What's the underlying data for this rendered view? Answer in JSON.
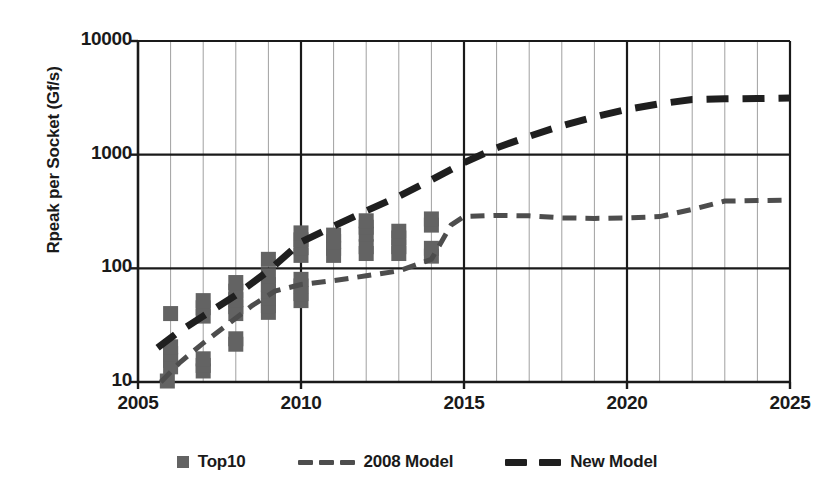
{
  "chart_data": {
    "type": "scatter",
    "title": "",
    "xlabel": "",
    "ylabel": "Rpeak per Socket (Gf/s)",
    "xlim": [
      2005,
      2025
    ],
    "ylim": [
      10,
      10000
    ],
    "yscale": "log",
    "grid": true,
    "legend_position": "bottom",
    "x_ticks": [
      "2005",
      "2010",
      "2015",
      "2020",
      "2025"
    ],
    "x_tick_values": [
      2005,
      2010,
      2015,
      2020,
      2025
    ],
    "y_ticks": [
      "10",
      "100",
      "1000",
      "10000"
    ],
    "y_tick_values": [
      10,
      100,
      1000,
      10000
    ],
    "minor_gridlines_x_every": 1,
    "colors": {
      "marker": "#636363",
      "model_2008": "#4d4d4d",
      "model_new": "#1f1f1f",
      "axis": "#1a1a1a",
      "gridline_minor": "#a0a0a0",
      "gridline_major": "#1a1a1a",
      "background": "#ffffff"
    },
    "series": [
      {
        "name": "Top10",
        "type": "scatter",
        "marker": "square",
        "color": "#636363",
        "points": [
          {
            "x": 2005.9,
            "y": 10.2
          },
          {
            "x": 2006.0,
            "y": 13.6
          },
          {
            "x": 2006.0,
            "y": 15.5
          },
          {
            "x": 2006.0,
            "y": 17.8
          },
          {
            "x": 2006.0,
            "y": 20.4
          },
          {
            "x": 2006.0,
            "y": 40.0
          },
          {
            "x": 2007.0,
            "y": 12.5
          },
          {
            "x": 2007.0,
            "y": 14.0
          },
          {
            "x": 2007.0,
            "y": 16.0
          },
          {
            "x": 2007.0,
            "y": 38.0
          },
          {
            "x": 2007.0,
            "y": 45.0
          },
          {
            "x": 2007.0,
            "y": 52.0
          },
          {
            "x": 2008.0,
            "y": 21.5
          },
          {
            "x": 2008.0,
            "y": 24.0
          },
          {
            "x": 2008.0,
            "y": 40.0
          },
          {
            "x": 2008.0,
            "y": 46.0
          },
          {
            "x": 2008.0,
            "y": 53.0
          },
          {
            "x": 2008.0,
            "y": 63.0
          },
          {
            "x": 2008.0,
            "y": 75.0
          },
          {
            "x": 2009.0,
            "y": 41.0
          },
          {
            "x": 2009.0,
            "y": 47.0
          },
          {
            "x": 2009.0,
            "y": 55.0
          },
          {
            "x": 2009.0,
            "y": 63.0
          },
          {
            "x": 2009.0,
            "y": 72.0
          },
          {
            "x": 2009.0,
            "y": 86.0
          },
          {
            "x": 2009.0,
            "y": 120.0
          },
          {
            "x": 2010.0,
            "y": 52.0
          },
          {
            "x": 2010.0,
            "y": 60.0
          },
          {
            "x": 2010.0,
            "y": 70.0
          },
          {
            "x": 2010.0,
            "y": 80.0
          },
          {
            "x": 2010.0,
            "y": 130.0
          },
          {
            "x": 2010.0,
            "y": 152.0
          },
          {
            "x": 2010.0,
            "y": 178.0
          },
          {
            "x": 2010.0,
            "y": 205.0
          },
          {
            "x": 2011.0,
            "y": 130.0
          },
          {
            "x": 2011.0,
            "y": 150.0
          },
          {
            "x": 2011.0,
            "y": 172.0
          },
          {
            "x": 2011.0,
            "y": 196.0
          },
          {
            "x": 2012.0,
            "y": 135.0
          },
          {
            "x": 2012.0,
            "y": 155.0
          },
          {
            "x": 2012.0,
            "y": 200.0
          },
          {
            "x": 2012.0,
            "y": 230.0
          },
          {
            "x": 2012.0,
            "y": 262.0
          },
          {
            "x": 2013.0,
            "y": 135.0
          },
          {
            "x": 2013.0,
            "y": 155.0
          },
          {
            "x": 2013.0,
            "y": 185.0
          },
          {
            "x": 2013.0,
            "y": 212.0
          },
          {
            "x": 2014.0,
            "y": 128.0
          },
          {
            "x": 2014.0,
            "y": 150.0
          },
          {
            "x": 2014.0,
            "y": 240.0
          },
          {
            "x": 2014.0,
            "y": 272.0
          }
        ]
      },
      {
        "name": "2008 Model",
        "type": "line",
        "style": "dashed-thin",
        "color": "#4d4d4d",
        "points": [
          {
            "x": 2005.7,
            "y": 10.0
          },
          {
            "x": 2006.3,
            "y": 15.0
          },
          {
            "x": 2007.0,
            "y": 22.0
          },
          {
            "x": 2007.8,
            "y": 33.0
          },
          {
            "x": 2008.5,
            "y": 47.0
          },
          {
            "x": 2009.2,
            "y": 63.0
          },
          {
            "x": 2010.0,
            "y": 72.0
          },
          {
            "x": 2011.0,
            "y": 78.0
          },
          {
            "x": 2012.0,
            "y": 86.0
          },
          {
            "x": 2013.0,
            "y": 95.0
          },
          {
            "x": 2014.0,
            "y": 120.0
          },
          {
            "x": 2014.6,
            "y": 240.0
          },
          {
            "x": 2015.0,
            "y": 285.0
          },
          {
            "x": 2016.0,
            "y": 292.0
          },
          {
            "x": 2017.0,
            "y": 290.0
          },
          {
            "x": 2018.0,
            "y": 278.0
          },
          {
            "x": 2019.0,
            "y": 275.0
          },
          {
            "x": 2020.0,
            "y": 278.0
          },
          {
            "x": 2021.0,
            "y": 285.0
          },
          {
            "x": 2022.0,
            "y": 330.0
          },
          {
            "x": 2023.0,
            "y": 390.0
          },
          {
            "x": 2024.0,
            "y": 395.0
          },
          {
            "x": 2025.0,
            "y": 398.0
          }
        ]
      },
      {
        "name": "New Model",
        "type": "line",
        "style": "dashed-thick",
        "color": "#1f1f1f",
        "points": [
          {
            "x": 2005.6,
            "y": 20.0
          },
          {
            "x": 2006.2,
            "y": 27.0
          },
          {
            "x": 2007.0,
            "y": 38.0
          },
          {
            "x": 2008.0,
            "y": 58.0
          },
          {
            "x": 2009.0,
            "y": 95.0
          },
          {
            "x": 2010.0,
            "y": 170.0
          },
          {
            "x": 2011.0,
            "y": 235.0
          },
          {
            "x": 2012.0,
            "y": 320.0
          },
          {
            "x": 2013.0,
            "y": 430.0
          },
          {
            "x": 2014.0,
            "y": 600.0
          },
          {
            "x": 2015.0,
            "y": 850.0
          },
          {
            "x": 2016.0,
            "y": 1150.0
          },
          {
            "x": 2017.0,
            "y": 1450.0
          },
          {
            "x": 2018.0,
            "y": 1800.0
          },
          {
            "x": 2019.0,
            "y": 2150.0
          },
          {
            "x": 2020.0,
            "y": 2500.0
          },
          {
            "x": 2021.0,
            "y": 2800.0
          },
          {
            "x": 2022.0,
            "y": 3050.0
          },
          {
            "x": 2023.0,
            "y": 3100.0
          },
          {
            "x": 2024.0,
            "y": 3120.0
          },
          {
            "x": 2025.0,
            "y": 3150.0
          }
        ]
      }
    ],
    "legend": [
      {
        "label": "Top10",
        "marker": "square-swatch"
      },
      {
        "label": "2008 Model",
        "marker": "dashed-thin-swatch"
      },
      {
        "label": "New Model",
        "marker": "dashed-thick-swatch"
      }
    ]
  }
}
